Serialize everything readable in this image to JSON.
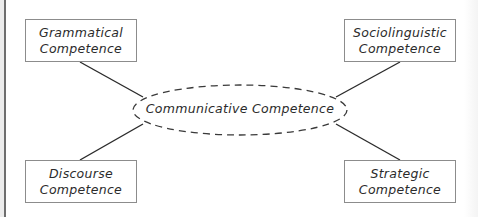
{
  "diagram": {
    "center": {
      "label": "Communicative Competence",
      "shape": "dashed-ellipse"
    },
    "nodes": [
      {
        "id": "grammatical",
        "line1": "Grammatical",
        "line2": "Competence",
        "position": "top-left"
      },
      {
        "id": "sociolinguistic",
        "line1": "Sociolinguistic",
        "line2": "Competence",
        "position": "top-right"
      },
      {
        "id": "discourse",
        "line1": "Discourse",
        "line2": "Competence",
        "position": "bottom-left"
      },
      {
        "id": "strategic",
        "line1": "Strategic",
        "line2": "Competence",
        "position": "bottom-right"
      }
    ],
    "edges": [
      {
        "from": "grammatical",
        "to": "center"
      },
      {
        "from": "sociolinguistic",
        "to": "center"
      },
      {
        "from": "discourse",
        "to": "center"
      },
      {
        "from": "strategic",
        "to": "center"
      }
    ],
    "colors": {
      "line": "#2b2b2b",
      "box_border": "#8c8c8c",
      "text": "#2b2b2b"
    }
  }
}
